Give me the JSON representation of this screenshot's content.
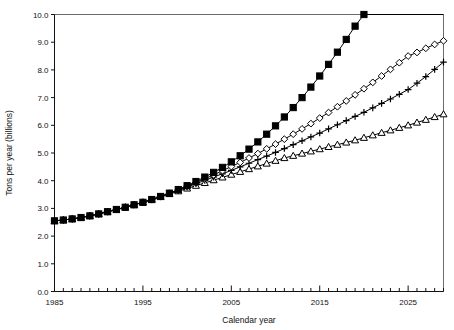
{
  "chart_data": {
    "type": "line",
    "title": "",
    "subtitle": "",
    "xlabel": "Calendar year",
    "ylabel": "Tons per year (billions)",
    "xlim": [
      1985,
      2029
    ],
    "ylim": [
      0.0,
      10.0
    ],
    "xticks": [
      1985,
      1995,
      2005,
      2015,
      2025
    ],
    "xtick_labels": [
      "1985",
      "1995",
      "2005",
      "2015",
      "2025"
    ],
    "xminor_step": 1,
    "yticks": [
      0.0,
      1.0,
      2.0,
      3.0,
      4.0,
      5.0,
      6.0,
      7.0,
      8.0,
      9.0,
      10.0
    ],
    "ytick_labels": [
      "0.0",
      "1.0",
      "2.0",
      "3.0",
      "4.0",
      "5.0",
      "6.0",
      "7.0",
      "8.0",
      "9.0",
      "10.0"
    ],
    "grid": false,
    "legend": "none",
    "marker_every": 1,
    "line_color": "#000000",
    "x": [
      1985,
      1986,
      1987,
      1988,
      1989,
      1990,
      1991,
      1992,
      1993,
      1994,
      1995,
      1996,
      1997,
      1998,
      1999,
      2000,
      2001,
      2002,
      2003,
      2004,
      2005,
      2006,
      2007,
      2008,
      2009,
      2010,
      2011,
      2012,
      2013,
      2014,
      2015,
      2016,
      2017,
      2018,
      2019,
      2020,
      2021,
      2022,
      2023,
      2024,
      2025,
      2026,
      2027,
      2028,
      2029
    ],
    "series": [
      {
        "name": "scenario-high",
        "marker": "filled-square",
        "marker_fill": "#000000",
        "clipped_at_top": true,
        "values": [
          2.55,
          2.58,
          2.62,
          2.67,
          2.73,
          2.8,
          2.88,
          2.96,
          3.04,
          3.13,
          3.22,
          3.32,
          3.43,
          3.55,
          3.68,
          3.82,
          3.97,
          4.13,
          4.3,
          4.48,
          4.68,
          4.9,
          5.14,
          5.4,
          5.68,
          5.98,
          6.3,
          6.64,
          7.0,
          7.38,
          7.78,
          8.2,
          8.64,
          9.1,
          9.58,
          10.0,
          null,
          null,
          null,
          null,
          null,
          null,
          null,
          null,
          null
        ]
      },
      {
        "name": "scenario-mid-high",
        "marker": "open-diamond",
        "marker_fill": "#ffffff",
        "clipped_at_top": false,
        "values": [
          2.55,
          2.58,
          2.62,
          2.67,
          2.73,
          2.8,
          2.88,
          2.96,
          3.04,
          3.13,
          3.22,
          3.32,
          3.43,
          3.55,
          3.67,
          3.8,
          3.93,
          4.07,
          4.21,
          4.36,
          4.51,
          4.66,
          4.82,
          4.98,
          5.15,
          5.32,
          5.5,
          5.68,
          5.87,
          6.06,
          6.26,
          6.46,
          6.67,
          6.88,
          7.1,
          7.32,
          7.55,
          7.78,
          8.02,
          8.26,
          8.5,
          8.63,
          8.78,
          8.92,
          9.05
        ]
      },
      {
        "name": "scenario-mid-low",
        "marker": "plus",
        "marker_fill": "none",
        "clipped_at_top": false,
        "values": [
          2.55,
          2.58,
          2.62,
          2.67,
          2.73,
          2.8,
          2.88,
          2.96,
          3.04,
          3.13,
          3.22,
          3.32,
          3.43,
          3.54,
          3.65,
          3.77,
          3.89,
          4.01,
          4.13,
          4.25,
          4.37,
          4.5,
          4.63,
          4.76,
          4.89,
          5.02,
          5.16,
          5.3,
          5.44,
          5.58,
          5.72,
          5.87,
          6.02,
          6.17,
          6.32,
          6.47,
          6.63,
          6.79,
          6.95,
          7.12,
          7.29,
          7.52,
          7.76,
          8.02,
          8.28
        ]
      },
      {
        "name": "scenario-low",
        "marker": "open-triangle",
        "marker_fill": "#ffffff",
        "clipped_at_top": false,
        "values": [
          2.55,
          2.58,
          2.62,
          2.67,
          2.73,
          2.8,
          2.88,
          2.96,
          3.04,
          3.13,
          3.22,
          3.32,
          3.42,
          3.52,
          3.62,
          3.72,
          3.82,
          3.92,
          4.02,
          4.12,
          4.22,
          4.32,
          4.42,
          4.52,
          4.62,
          4.72,
          4.82,
          4.9,
          4.98,
          5.06,
          5.14,
          5.22,
          5.3,
          5.38,
          5.46,
          5.55,
          5.64,
          5.73,
          5.82,
          5.91,
          6.0,
          6.1,
          6.2,
          6.3,
          6.4
        ]
      }
    ]
  }
}
